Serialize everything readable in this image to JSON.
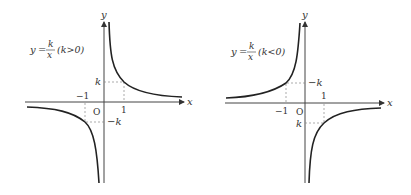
{
  "left_graph": {
    "formula_y": "y",
    "formula_eq": "=",
    "formula_num": "k",
    "formula_den": "x",
    "condition": "(k>0)",
    "x_axis_label": "x",
    "y_axis_label": "y",
    "origin_label": "O",
    "tick_pos_x": "1",
    "tick_neg_x": "−1",
    "tick_pos_y": "k",
    "tick_neg_y": "−k"
  },
  "right_graph": {
    "formula_y": "y",
    "formula_eq": "=",
    "formula_num": "k",
    "formula_den": "x",
    "condition": "(k<0)",
    "x_axis_label": "x",
    "y_axis_label": "y",
    "origin_label": "O",
    "tick_pos_x": "1",
    "tick_neg_x": "−1",
    "tick_upper_y": "−k",
    "tick_lower_y": "k"
  },
  "colors": {
    "curve": "#222222",
    "axis": "#444444",
    "dash": "#888888"
  }
}
